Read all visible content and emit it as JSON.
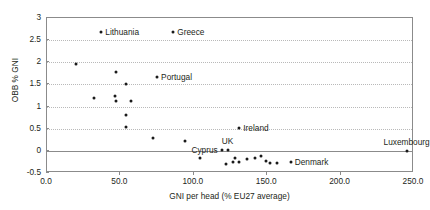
{
  "chart_data": {
    "type": "scatter",
    "title": "",
    "xlabel": "GNI per head (% EU27 average)",
    "ylabel": "OBB % GNI",
    "xlim": [
      0,
      250
    ],
    "ylim": [
      -0.5,
      3
    ],
    "xticks": [
      "0.0",
      "50.0",
      "100.0",
      "150.0",
      "200.0",
      "250.0"
    ],
    "xtick_values": [
      0,
      50,
      100,
      150,
      200,
      250
    ],
    "yticks": [
      "-0.5",
      "0",
      "0.5",
      "1",
      "1.5",
      "2",
      "2.5",
      "3"
    ],
    "ytick_values": [
      -0.5,
      0,
      0.5,
      1,
      1.5,
      2,
      2.5,
      3
    ],
    "grid": "horizontal-dotted",
    "legend": "none",
    "zero_line": 0,
    "points": [
      {
        "x": 37,
        "y": 2.68,
        "label": "Lithuania",
        "label_pos": "right"
      },
      {
        "x": 86,
        "y": 2.68,
        "label": "Greece",
        "label_pos": "right"
      },
      {
        "x": 20,
        "y": 1.96,
        "label": "",
        "label_pos": "none"
      },
      {
        "x": 47,
        "y": 1.78,
        "label": "",
        "label_pos": "none"
      },
      {
        "x": 75,
        "y": 1.66,
        "label": "Portugal",
        "label_pos": "right"
      },
      {
        "x": 54,
        "y": 1.5,
        "label": "",
        "label_pos": "none"
      },
      {
        "x": 32,
        "y": 1.19,
        "label": "",
        "label_pos": "none"
      },
      {
        "x": 46,
        "y": 1.25,
        "label": "",
        "label_pos": "none"
      },
      {
        "x": 47,
        "y": 1.12,
        "label": "",
        "label_pos": "none"
      },
      {
        "x": 57,
        "y": 1.13,
        "label": "",
        "label_pos": "none"
      },
      {
        "x": 54,
        "y": 0.82,
        "label": "",
        "label_pos": "none"
      },
      {
        "x": 54,
        "y": 0.53,
        "label": "",
        "label_pos": "none"
      },
      {
        "x": 72,
        "y": 0.29,
        "label": "",
        "label_pos": "none"
      },
      {
        "x": 94,
        "y": 0.23,
        "label": "",
        "label_pos": "none"
      },
      {
        "x": 119,
        "y": 0.01,
        "label": "Cyprus",
        "label_pos": "left"
      },
      {
        "x": 104,
        "y": -0.15,
        "label": "",
        "label_pos": "none"
      },
      {
        "x": 122,
        "y": -0.29,
        "label": "",
        "label_pos": "none"
      },
      {
        "x": 131,
        "y": 0.51,
        "label": "Ireland",
        "label_pos": "right"
      },
      {
        "x": 123,
        "y": 0.02,
        "label": "UK",
        "label_pos": "above"
      },
      {
        "x": 128,
        "y": -0.17,
        "label": "",
        "label_pos": "none"
      },
      {
        "x": 127,
        "y": -0.25,
        "label": "",
        "label_pos": "none"
      },
      {
        "x": 131,
        "y": -0.26,
        "label": "",
        "label_pos": "none"
      },
      {
        "x": 136,
        "y": -0.19,
        "label": "",
        "label_pos": "none"
      },
      {
        "x": 142,
        "y": -0.17,
        "label": "",
        "label_pos": "none"
      },
      {
        "x": 146,
        "y": -0.12,
        "label": "",
        "label_pos": "none"
      },
      {
        "x": 149,
        "y": -0.22,
        "label": "",
        "label_pos": "none"
      },
      {
        "x": 152,
        "y": -0.27,
        "label": "",
        "label_pos": "none"
      },
      {
        "x": 157,
        "y": -0.28,
        "label": "",
        "label_pos": "none"
      },
      {
        "x": 166,
        "y": -0.25,
        "label": "Denmark",
        "label_pos": "right"
      },
      {
        "x": 245,
        "y": 0.0,
        "label": "Luxembourg",
        "label_pos": "above"
      }
    ]
  },
  "colors": {
    "marker": "#1a1a1a",
    "axis": "#8b8b8b",
    "grid": "#b9b9b9",
    "text": "#231f20",
    "background": "#ffffff"
  }
}
